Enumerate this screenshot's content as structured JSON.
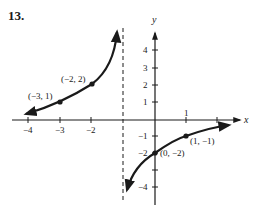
{
  "problem_number": "13.",
  "axes": {
    "x_label": "x",
    "y_label": "y",
    "x_ticks": [
      {
        "value": -4,
        "label": "−4"
      },
      {
        "value": -3,
        "label": "−3"
      },
      {
        "value": -2,
        "label": "−2"
      },
      {
        "value": -1,
        "label": ""
      },
      {
        "value": 1,
        "label": "1"
      },
      {
        "value": 2,
        "label": ""
      }
    ],
    "y_ticks": [
      {
        "value": 4,
        "label": "4"
      },
      {
        "value": 3,
        "label": "3"
      },
      {
        "value": 2,
        "label": "2"
      },
      {
        "value": 1,
        "label": "1"
      },
      {
        "value": -1,
        "label": "−1"
      },
      {
        "value": -2,
        "label": "−2"
      },
      {
        "value": -3,
        "label": ""
      },
      {
        "value": -4,
        "label": "−4"
      }
    ]
  },
  "asymptote": {
    "x": -1,
    "style": "dashed"
  },
  "points": [
    {
      "x": -3,
      "y": 1,
      "label": "(−3, 1)"
    },
    {
      "x": -2,
      "y": 2,
      "label": "(−2, 2)"
    },
    {
      "x": 0,
      "y": -2,
      "label": "(0, −2)"
    },
    {
      "x": 1,
      "y": -1,
      "label": "(1, −1)"
    }
  ],
  "labels": {
    "p1": "(−3, 1)",
    "p2": "(−2, 2)",
    "p3": "(0, −2)",
    "p4": "(1, −1)",
    "xt_m4": "−4",
    "xt_m3": "−3",
    "xt_m2": "−2",
    "xt_1": "1",
    "yt_4": "4",
    "yt_3": "3",
    "yt_2": "2",
    "yt_1": "1",
    "yt_m1": "−1",
    "yt_m2": "−2",
    "yt_m4": "−4"
  },
  "branches": [
    {
      "name": "left-branch",
      "domain": "x < -1",
      "passes_through": [
        "(-3, 1)",
        "(-2, 2)"
      ],
      "left_end": "approaches x-axis",
      "right_end": "rises toward asymptote x = -1"
    },
    {
      "name": "right-branch",
      "domain": "x > -1",
      "passes_through": [
        "(0, -2)",
        "(1, -1)"
      ],
      "left_end": "falls toward asymptote x = -1",
      "right_end": "approaches x-axis from below"
    }
  ]
}
